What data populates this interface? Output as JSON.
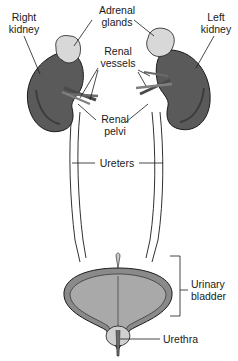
{
  "diagram": {
    "labels": {
      "right_kidney": [
        "Right",
        "kidney"
      ],
      "adrenal_glands": [
        "Adrenal",
        "glands"
      ],
      "left_kidney": [
        "Left",
        "kidney"
      ],
      "renal_vessels": [
        "Renal",
        "vessels"
      ],
      "renal_pelvi": [
        "Renal",
        "pelvi"
      ],
      "ureters": "Ureters",
      "urinary_bladder": [
        "Urinary",
        "bladder"
      ],
      "urethra": "Urethra"
    },
    "colors": {
      "kidney": "#5a5a5a",
      "kidney_shadow": "#3c3c3c",
      "adrenal": "#d8d8d8",
      "ureter": "#f2f2f2",
      "bladder_outer": "#8a8a8a",
      "bladder_inner": "#a9a9a9",
      "outline": "#1a1a1a"
    }
  }
}
